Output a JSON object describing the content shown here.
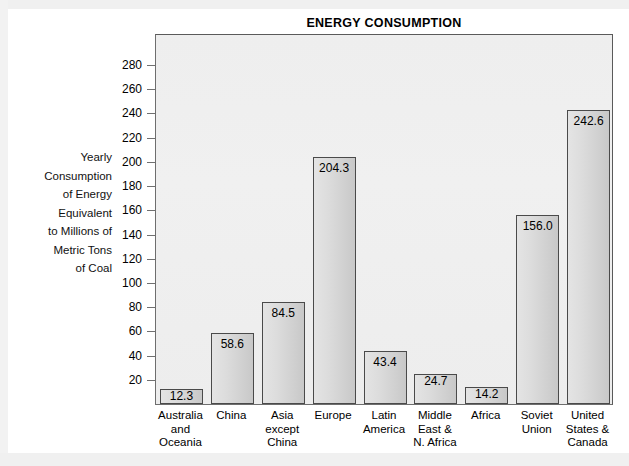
{
  "chart_data": {
    "type": "bar",
    "title": "ENERGY CONSUMPTION",
    "xlabel": "",
    "ylabel": "Yearly Consumption of Energy Equivalent to Millions of Metric Tons of Coal",
    "ylabel_lines": [
      "Yearly",
      "Consumption",
      "of Energy",
      "Equivalent",
      "to Millions of",
      "Metric Tons",
      "of Coal"
    ],
    "ylim": [
      0,
      295
    ],
    "yticks": [
      280,
      260,
      240,
      220,
      200,
      180,
      160,
      140,
      120,
      100,
      80,
      60,
      40,
      20
    ],
    "grid": false,
    "legend": false,
    "categories": [
      "Australia and Oceania",
      "China",
      "Asia except China",
      "Europe",
      "Latin America",
      "Middle East & N. Africa",
      "Africa",
      "Soviet Union",
      "United States & Canada"
    ],
    "category_lines": [
      [
        "Australia",
        "and",
        "Oceania"
      ],
      [
        "China"
      ],
      [
        "Asia",
        "except",
        "China"
      ],
      [
        "Europe"
      ],
      [
        "Latin",
        "America"
      ],
      [
        "Middle",
        "East &",
        "N. Africa"
      ],
      [
        "Africa"
      ],
      [
        "Soviet",
        "Union"
      ],
      [
        "United",
        "States &",
        "Canada"
      ]
    ],
    "values": [
      12.3,
      58.6,
      84.5,
      204.3,
      43.4,
      24.7,
      14.2,
      156.0,
      242.6
    ],
    "value_labels": [
      "12.3",
      "58.6",
      "84.5",
      "204.3",
      "43.4",
      "24.7",
      "14.2",
      "156.0",
      "242.6"
    ],
    "colors": {
      "bar_fill_light": "#e4e4e4",
      "bar_fill_dark": "#c8c8c8",
      "bar_border": "#4a4a4a",
      "plot_background": "#efefef",
      "plot_border": "#6e6e6e",
      "text": "#000000",
      "page_background": "#ffffff"
    }
  }
}
